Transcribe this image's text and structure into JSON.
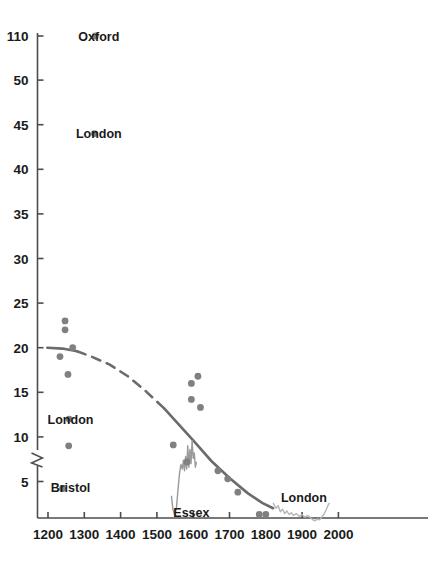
{
  "chart_data": {
    "type": "scatter",
    "title": "",
    "xlabel": "",
    "ylabel": "",
    "xlim": [
      1150,
      2020
    ],
    "ylim": [
      0,
      115
    ],
    "grid": false,
    "legend": "none",
    "axis_break": {
      "present": true,
      "below": 50,
      "above": 110,
      "note": "y-axis broken between 50 and 110"
    },
    "xticks": [
      1200,
      1300,
      1400,
      1500,
      1600,
      1700,
      1800,
      1900,
      2000
    ],
    "xtick_labels": [
      "1200",
      "1300",
      "1400",
      "1500",
      "1600",
      "1700",
      "1800",
      "1900",
      "2000"
    ],
    "yticks": [
      5,
      10,
      15,
      20,
      25,
      30,
      35,
      40,
      45,
      50,
      110
    ],
    "ytick_labels": [
      "5",
      "10",
      "15",
      "20",
      "25",
      "30",
      "35",
      "40",
      "45",
      "50",
      "110"
    ],
    "annotations": [
      {
        "text": "Oxford",
        "x": 1340,
        "y": 110
      },
      {
        "text": "London",
        "x": 1340,
        "y": 44
      },
      {
        "text": "London",
        "x": 1262,
        "y": 12
      },
      {
        "text": "Bristol",
        "x": 1262,
        "y": 4.3
      },
      {
        "text": "Essex",
        "x": 1595,
        "y": 1.5
      },
      {
        "text": "London",
        "x": 1905,
        "y": 3.2
      }
    ],
    "series": [
      {
        "name": "scatter-points",
        "type": "scatter",
        "marker": "circle",
        "color": "#808080",
        "points": [
          {
            "x": 1330,
            "y": 110
          },
          {
            "x": 1328,
            "y": 44
          },
          {
            "x": 1247,
            "y": 23
          },
          {
            "x": 1247,
            "y": 22
          },
          {
            "x": 1268,
            "y": 20
          },
          {
            "x": 1233,
            "y": 19
          },
          {
            "x": 1255,
            "y": 17
          },
          {
            "x": 1258,
            "y": 12
          },
          {
            "x": 1257,
            "y": 9
          },
          {
            "x": 1240,
            "y": 4.2
          },
          {
            "x": 1613,
            "y": 16.8
          },
          {
            "x": 1595,
            "y": 16
          },
          {
            "x": 1595,
            "y": 14.2
          },
          {
            "x": 1620,
            "y": 13.3
          },
          {
            "x": 1545,
            "y": 9.1
          },
          {
            "x": 1583,
            "y": 7.2
          },
          {
            "x": 1668,
            "y": 6.2
          },
          {
            "x": 1695,
            "y": 5.3
          },
          {
            "x": 1723,
            "y": 3.8
          },
          {
            "x": 1782,
            "y": 1.3
          },
          {
            "x": 1800,
            "y": 1.3
          }
        ]
      },
      {
        "name": "trend-line",
        "type": "line",
        "color": "#6b6b6b",
        "style": "solid-dashed-solid",
        "points": [
          {
            "x": 1198,
            "y": 20.0
          },
          {
            "x": 1240,
            "y": 19.9
          },
          {
            "x": 1280,
            "y": 19.6
          },
          {
            "x": 1320,
            "y": 19.0
          },
          {
            "x": 1370,
            "y": 18.1
          },
          {
            "x": 1420,
            "y": 16.8
          },
          {
            "x": 1470,
            "y": 15.1
          },
          {
            "x": 1520,
            "y": 13.2
          },
          {
            "x": 1560,
            "y": 11.4
          },
          {
            "x": 1600,
            "y": 9.6
          },
          {
            "x": 1650,
            "y": 7.3
          },
          {
            "x": 1700,
            "y": 5.4
          },
          {
            "x": 1750,
            "y": 3.7
          },
          {
            "x": 1790,
            "y": 2.6
          },
          {
            "x": 1820,
            "y": 2.0
          }
        ],
        "dashed_from": 1270,
        "dashed_to": 1510
      },
      {
        "name": "essex-series",
        "type": "line",
        "color": "#9a9a9a",
        "label": "Essex",
        "points": [
          {
            "x": 1540,
            "y": 3.4
          },
          {
            "x": 1544,
            "y": 1.9
          },
          {
            "x": 1549,
            "y": 1.2
          },
          {
            "x": 1554,
            "y": 2.1
          },
          {
            "x": 1558,
            "y": 4.0
          },
          {
            "x": 1562,
            "y": 5.8
          },
          {
            "x": 1566,
            "y": 6.9
          },
          {
            "x": 1570,
            "y": 6.4
          },
          {
            "x": 1573,
            "y": 7.4
          },
          {
            "x": 1576,
            "y": 6.2
          },
          {
            "x": 1579,
            "y": 7.8
          },
          {
            "x": 1582,
            "y": 6.4
          },
          {
            "x": 1585,
            "y": 9.0
          },
          {
            "x": 1588,
            "y": 6.6
          },
          {
            "x": 1591,
            "y": 8.6
          },
          {
            "x": 1594,
            "y": 7.0
          },
          {
            "x": 1597,
            "y": 9.6
          },
          {
            "x": 1600,
            "y": 7.6
          },
          {
            "x": 1603,
            "y": 8.2
          },
          {
            "x": 1606,
            "y": 6.6
          },
          {
            "x": 1609,
            "y": 7.2
          }
        ]
      },
      {
        "name": "london-series",
        "type": "line",
        "color": "#b5b5b5",
        "label": "London",
        "points": [
          {
            "x": 1820,
            "y": 2.6
          },
          {
            "x": 1828,
            "y": 2.0
          },
          {
            "x": 1834,
            "y": 2.3
          },
          {
            "x": 1840,
            "y": 1.6
          },
          {
            "x": 1846,
            "y": 1.9
          },
          {
            "x": 1852,
            "y": 1.4
          },
          {
            "x": 1858,
            "y": 1.7
          },
          {
            "x": 1864,
            "y": 1.3
          },
          {
            "x": 1870,
            "y": 1.5
          },
          {
            "x": 1876,
            "y": 1.2
          },
          {
            "x": 1884,
            "y": 1.4
          },
          {
            "x": 1892,
            "y": 1.1
          },
          {
            "x": 1900,
            "y": 1.3
          },
          {
            "x": 1908,
            "y": 1.0
          },
          {
            "x": 1916,
            "y": 1.2
          },
          {
            "x": 1924,
            "y": 0.9
          },
          {
            "x": 1930,
            "y": 0.7
          },
          {
            "x": 1936,
            "y": 0.6
          },
          {
            "x": 1942,
            "y": 0.8
          },
          {
            "x": 1948,
            "y": 0.7
          },
          {
            "x": 1954,
            "y": 1.0
          },
          {
            "x": 1960,
            "y": 1.3
          },
          {
            "x": 1966,
            "y": 1.8
          },
          {
            "x": 1972,
            "y": 2.4
          },
          {
            "x": 1976,
            "y": 2.6
          }
        ]
      }
    ]
  },
  "axis": {
    "line_color": "#4d4d4d",
    "tick_color": "#4d4d4d"
  }
}
